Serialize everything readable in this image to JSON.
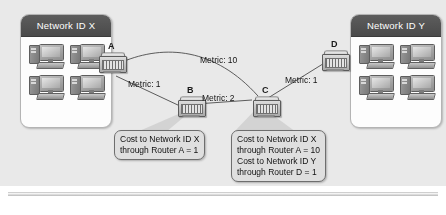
{
  "figure": {
    "background_color": "#e9e9e9",
    "caption": ""
  },
  "networks": [
    {
      "id": "net-x",
      "title": "Network ID X",
      "hosts": [
        "workstation",
        "workstation",
        "workstation",
        "workstation"
      ]
    },
    {
      "id": "net-y",
      "title": "Network ID Y",
      "hosts": [
        "workstation",
        "workstation",
        "workstation",
        "workstation"
      ]
    }
  ],
  "routers": [
    {
      "id": "router-a",
      "label": "A"
    },
    {
      "id": "router-b",
      "label": "B"
    },
    {
      "id": "router-c",
      "label": "C"
    },
    {
      "id": "router-d",
      "label": "D"
    }
  ],
  "links": [
    {
      "id": "link-a-c",
      "from": "A",
      "to": "C",
      "metric_label": "Metric: 10"
    },
    {
      "id": "link-a-b",
      "from": "A",
      "to": "B",
      "metric_label": "Metric: 1"
    },
    {
      "id": "link-b-c",
      "from": "B",
      "to": "C",
      "metric_label": "Metric: 2"
    },
    {
      "id": "link-c-d",
      "from": "C",
      "to": "D",
      "metric_label": "Metric: 1"
    }
  ],
  "callouts": {
    "router_b": {
      "lines": [
        "Cost to Network ID X",
        "through Router A = 1"
      ]
    },
    "router_c": {
      "lines": [
        "Cost to Network ID X",
        "through Router A = 10",
        "Cost to Network ID Y",
        "through Router D = 1"
      ]
    }
  }
}
